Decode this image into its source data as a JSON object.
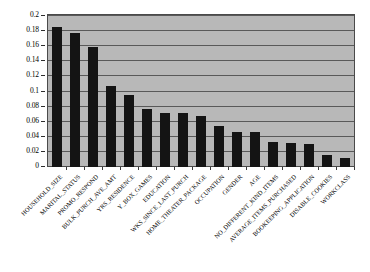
{
  "chart_data": {
    "type": "bar",
    "title": "",
    "subtitle": "",
    "xlabel": "",
    "ylabel": "",
    "ylim": [
      0,
      0.2
    ],
    "ytick_values": [
      0,
      0.02,
      0.04,
      0.06,
      0.08,
      0.1,
      0.12,
      0.14,
      0.16,
      0.18,
      0.2
    ],
    "ytick_labels": [
      "0",
      "0.02",
      "0.04",
      "0.06",
      "0.08",
      "0.1",
      "0.12",
      "0.14",
      "0.16",
      "0.18",
      "0.2"
    ],
    "grid": true,
    "grid_axis": "y",
    "legend": false,
    "legend_position": "none",
    "orientation": "vertical",
    "sorted": "descending",
    "plot_background_color": "#b8b8b8",
    "bar_color": "#141414",
    "grid_color": "#595959",
    "categories": [
      "HOUSEHOLD_SIZE",
      "MARITAL_STATUS",
      "PROMO_RESPOND",
      "BULK_PURCH_AVE_AMT",
      "YRS_RESIDENCE",
      "Y_BOX_GAMES",
      "EDUCATION",
      "WKS_SINCE_LAST_PURCH",
      "HOME_THEATER_PACKAGE",
      "OCCUPATION",
      "GENDER",
      "AGE",
      "NO_DIFFERENT_KIND_ITEMS",
      "AVERAGE_ITEMS_PURCHASED",
      "BOOKEEPING_APPLICATION",
      "DISABLE_COOKIES",
      "WORKCLASS"
    ],
    "values": [
      0.186,
      0.178,
      0.159,
      0.107,
      0.096,
      0.077,
      0.072,
      0.072,
      0.068,
      0.054,
      0.046,
      0.046,
      0.033,
      0.032,
      0.031,
      0.016,
      0.012
    ]
  }
}
